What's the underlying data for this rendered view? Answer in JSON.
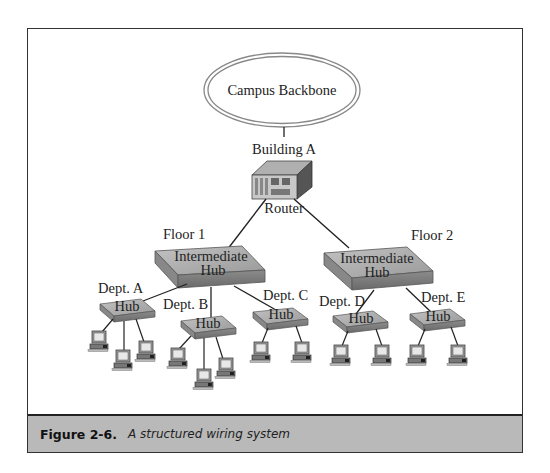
{
  "diagram": {
    "backbone": {
      "label": "Campus Backbone"
    },
    "building": {
      "label": "Building A"
    },
    "router": {
      "label": "Router"
    },
    "floors": [
      {
        "label": "Floor 1",
        "hub_line1": "Intermediate",
        "hub_line2": "Hub"
      },
      {
        "label": "Floor 2",
        "hub_line1": "Intermediate",
        "hub_line2": "Hub"
      }
    ],
    "departments": [
      {
        "label": "Dept. A",
        "hub": "Hub",
        "floor": 1,
        "computers": 3
      },
      {
        "label": "Dept. B",
        "hub": "Hub",
        "floor": 1,
        "computers": 3
      },
      {
        "label": "Dept. C",
        "hub": "Hub",
        "floor": 1,
        "computers": 2
      },
      {
        "label": "Dept. D",
        "hub": "Hub",
        "floor": 2,
        "computers": 2
      },
      {
        "label": "Dept. E",
        "hub": "Hub",
        "floor": 2,
        "computers": 2
      }
    ]
  },
  "caption": {
    "number": "Figure 2-6.",
    "text": "A structured wiring system"
  },
  "colors": {
    "hub_top": "#a8a8a8",
    "hub_side": "#7a7a7a",
    "caption_bg": "#b9b9b9",
    "frame": "#333333"
  }
}
